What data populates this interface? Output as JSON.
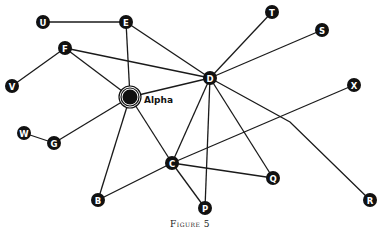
{
  "caption": "Figure 5",
  "colors": {
    "node": "#111111",
    "edge": "#1a1a1a",
    "background": "#ffffff"
  },
  "special_node": {
    "id": "Alpha",
    "label": "Alpha",
    "x": 130,
    "y": 97
  },
  "nodes": [
    {
      "id": "U",
      "x": 43,
      "y": 22
    },
    {
      "id": "E",
      "x": 126,
      "y": 22
    },
    {
      "id": "F",
      "x": 65,
      "y": 48
    },
    {
      "id": "V",
      "x": 12,
      "y": 86
    },
    {
      "id": "D",
      "x": 210,
      "y": 78
    },
    {
      "id": "T",
      "x": 272,
      "y": 12
    },
    {
      "id": "S",
      "x": 322,
      "y": 30
    },
    {
      "id": "X",
      "x": 354,
      "y": 85
    },
    {
      "id": "W",
      "x": 24,
      "y": 133
    },
    {
      "id": "G",
      "x": 54,
      "y": 143
    },
    {
      "id": "C",
      "x": 172,
      "y": 163
    },
    {
      "id": "B",
      "x": 98,
      "y": 200
    },
    {
      "id": "P",
      "x": 205,
      "y": 208
    },
    {
      "id": "Q",
      "x": 273,
      "y": 178
    },
    {
      "id": "R",
      "x": 370,
      "y": 200
    }
  ],
  "edges": [
    [
      "U",
      "E"
    ],
    [
      "E",
      "Alpha"
    ],
    [
      "E",
      "D"
    ],
    [
      "F",
      "V"
    ],
    [
      "F",
      "Alpha"
    ],
    [
      "F",
      "D"
    ],
    [
      "Alpha",
      "D"
    ],
    [
      "Alpha",
      "G"
    ],
    [
      "G",
      "W"
    ],
    [
      "Alpha",
      "B"
    ],
    [
      "Alpha",
      "C"
    ],
    [
      "D",
      "T"
    ],
    [
      "D",
      "S"
    ],
    [
      "D",
      "C"
    ],
    [
      "D",
      "P"
    ],
    [
      "D",
      "Q"
    ],
    [
      "D",
      "R"
    ],
    [
      "C",
      "X"
    ],
    [
      "C",
      "B"
    ],
    [
      "C",
      "Q"
    ],
    [
      "C",
      "P"
    ]
  ],
  "edge_bends": {
    "D-R": [
      [
        290,
        122
      ]
    ]
  }
}
